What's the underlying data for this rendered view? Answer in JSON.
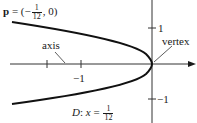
{
  "diagram": {
    "type": "parabola",
    "focus_label": {
      "var": "p",
      "prefix": " = (−",
      "frac_num": "1",
      "frac_den": "12",
      "suffix": ", 0)"
    },
    "axis_label": "axis",
    "vertex_label": "vertex",
    "directrix_label": {
      "prefix": "D",
      "middle": ": ",
      "var": "x",
      "eq": " = ",
      "frac_num": "1",
      "frac_den": "12"
    },
    "ticks": {
      "y_pos": "1",
      "y_neg": "−1",
      "x_neg": "−1"
    },
    "colors": {
      "stroke": "#1a1a1a",
      "background": "#ffffff"
    }
  }
}
